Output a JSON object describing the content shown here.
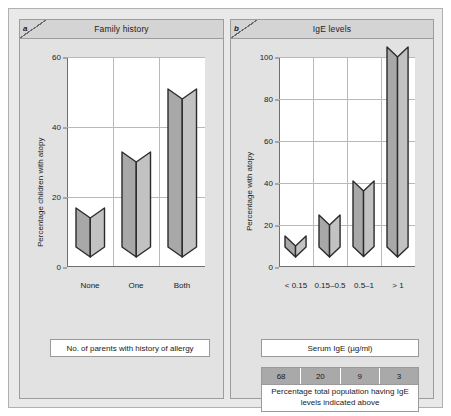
{
  "figure": {
    "panels": [
      {
        "id": "a",
        "tab_letter": "a",
        "title": "Family history",
        "caption": "No. of parents with history of allergy"
      },
      {
        "id": "b",
        "tab_letter": "b",
        "title": "IgE levels",
        "caption": "Serum IgE (µg/ml)"
      }
    ]
  },
  "table": {
    "values": [
      "68",
      "20",
      "9",
      "3"
    ],
    "note": "Percentage total population having IgE levels indicated above"
  },
  "colors": {
    "frame_bg": "#e9e9e9",
    "panel_bg": "#e2e2e2",
    "header_bg": "#d4d4d4",
    "plot_bg": "#ffffff",
    "bar_left_face": "#a8a8a8",
    "bar_right_face": "#c2c2c2",
    "bar_outline": "#2b2b2b",
    "gridline": "#b9b9b9",
    "axis": "#6f6f6f",
    "table_cell_bg": "#a9a9a9"
  },
  "chart_data": [
    {
      "type": "bar",
      "panel": "a",
      "title": "Family history",
      "xlabel": "No. of parents with history of allergy",
      "ylabel": "Percentage children with atopy",
      "categories": [
        "None",
        "One",
        "Both"
      ],
      "values": [
        14,
        30,
        48
      ],
      "ylim": [
        0,
        60
      ],
      "yticks": [
        0,
        20,
        40,
        60
      ],
      "grid": true,
      "legend": "none",
      "style": "3d-prism"
    },
    {
      "type": "bar",
      "panel": "b",
      "title": "IgE levels",
      "xlabel": "Serum IgE (µg/ml)",
      "ylabel": "Percentage with atopy",
      "categories": [
        "< 0.15",
        "0.15–0.5",
        "0.5–1",
        "> 1"
      ],
      "values": [
        10,
        20,
        36,
        100
      ],
      "ylim": [
        0,
        100
      ],
      "yticks": [
        0,
        20,
        40,
        60,
        80,
        100
      ],
      "grid": true,
      "legend": "none",
      "style": "3d-prism",
      "annotation_table": {
        "label": "Percentage total population having IgE levels indicated above",
        "values": [
          68,
          20,
          9,
          3
        ]
      }
    }
  ]
}
